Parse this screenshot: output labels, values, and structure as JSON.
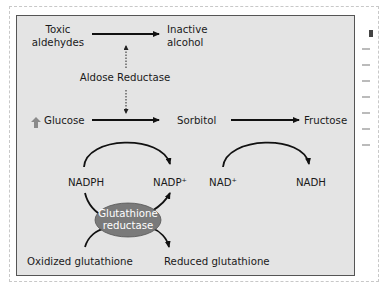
{
  "diagram": {
    "type": "metabolic-pathway",
    "title": "",
    "nodes": {
      "toxic_aldehydes": [
        "Toxic",
        "aldehydes"
      ],
      "inactive_alcohol": [
        "Inactive",
        "alcohol"
      ],
      "aldose_reductase": "Aldose Reductase",
      "glucose": "Glucose",
      "glucose_indicator": "increased",
      "sorbitol": "Sorbitol",
      "fructose": "Fructose",
      "nadph": "NADPH",
      "nadp_plus": "NADP⁺",
      "nad_plus": "NAD⁺",
      "nadh": "NADH",
      "enzyme_ellipse": [
        "Glutathione",
        "reductase"
      ],
      "oxidized_glutathione": "Oxidized glutathione",
      "reduced_glutathione": "Reduced glutathione"
    },
    "edges": [
      {
        "from": "Toxic aldehydes",
        "to": "Inactive alcohol",
        "style": "solid-arrow"
      },
      {
        "from": "Aldose Reductase",
        "to": "Toxic aldehydes reaction",
        "style": "dotted-arrow"
      },
      {
        "from": "Aldose Reductase",
        "to": "Glucose reaction",
        "style": "dotted-arrow"
      },
      {
        "from": "Glucose",
        "to": "Sorbitol",
        "style": "solid-arrow"
      },
      {
        "from": "Sorbitol",
        "to": "Fructose",
        "style": "solid-arrow"
      },
      {
        "from": "NADPH",
        "to": "NADP⁺",
        "style": "curved-arrow"
      },
      {
        "from": "NAD⁺",
        "to": "NADH",
        "style": "curved-arrow"
      },
      {
        "from": "Oxidized glutathione",
        "to": "Reduced glutathione",
        "via": "Glutathione reductase",
        "style": "curved-arrow"
      }
    ],
    "colors": {
      "panel_bg": "#e4e4e4",
      "panel_border": "#555555",
      "ellipse_fill": "#7a7a7a",
      "arrow": "#111111",
      "up_arrow": "#8a8a8a"
    }
  }
}
